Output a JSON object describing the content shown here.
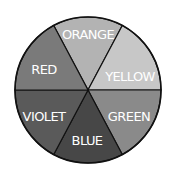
{
  "diagram": {
    "type": "color-wheel",
    "center": [
      88,
      90
    ],
    "radius": 73,
    "segments": [
      {
        "label": "ORANGE",
        "fill": "#b3b3b3",
        "label_pos": [
          88,
          35
        ]
      },
      {
        "label": "YELLOW",
        "fill": "#c7c7c7",
        "label_pos": [
          130,
          77
        ]
      },
      {
        "label": "GREEN",
        "fill": "#8a8a8a",
        "label_pos": [
          129,
          117
        ]
      },
      {
        "label": "BLUE",
        "fill": "#474747",
        "label_pos": [
          87,
          141
        ]
      },
      {
        "label": "VIOLET",
        "fill": "#5a5a5a",
        "label_pos": [
          44,
          117
        ]
      },
      {
        "label": "RED",
        "fill": "#7a7a7a",
        "label_pos": [
          44,
          70
        ]
      }
    ],
    "outline_color": "#111111"
  }
}
